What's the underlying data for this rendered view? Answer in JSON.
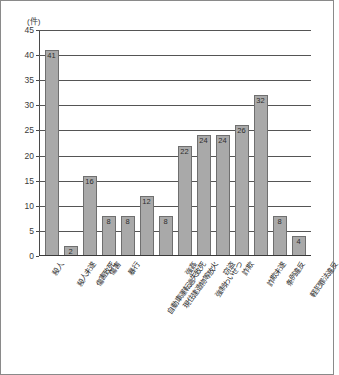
{
  "chart_data": {
    "type": "bar",
    "title": "",
    "subtitle": "",
    "unit_label": "(件)",
    "xlabel": "",
    "ylabel": "",
    "ylim": [
      0,
      45
    ],
    "ytick_step": 5,
    "yticks": [
      "45",
      "40",
      "35",
      "30",
      "25",
      "20",
      "15",
      "10",
      "5",
      "0"
    ],
    "grid": true,
    "legend": false,
    "legend_position": "none",
    "bar_color": "#a9a9a9",
    "bar_border_color": "#6f6f6f",
    "axis_color": "#3a3a3a",
    "gridline_color": "#555555",
    "categories": [
      "殺人",
      "殺人未遂",
      "傷害致死",
      "傷害",
      "暴行",
      "自動車運転過失致死",
      "現住建造物等放火",
      "強姦",
      "強制わいせつ",
      "窃盗",
      "詐欺",
      "詐欺未遂",
      "条例違反",
      "軽犯罪法違反"
    ],
    "values": [
      41,
      2,
      16,
      8,
      8,
      12,
      8,
      22,
      24,
      24,
      26,
      32,
      8,
      4
    ],
    "data_labels": [
      "41",
      "2",
      "16",
      "8",
      "8",
      "12",
      "8",
      "22",
      "24",
      "24",
      "26",
      "32",
      "8",
      "4"
    ]
  }
}
